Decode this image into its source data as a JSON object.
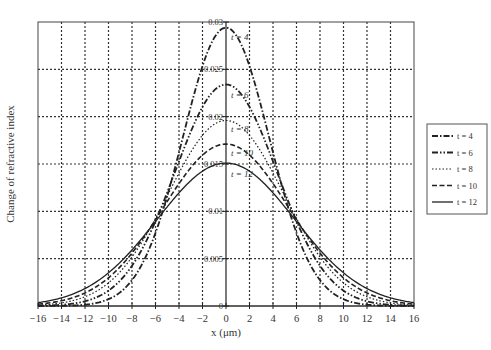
{
  "chart_data": {
    "type": "line",
    "title": "",
    "xlabel": "x (μm)",
    "ylabel": "Change of refractive index",
    "xlim": [
      -16,
      16
    ],
    "ylim": [
      0,
      0.03
    ],
    "xticks": [
      -16,
      -14,
      -12,
      -10,
      -8,
      -6,
      -4,
      -2,
      0,
      2,
      4,
      6,
      8,
      10,
      12,
      14,
      16
    ],
    "xtick_labels": [
      "−16",
      "−14",
      "−12",
      "−10",
      "−8",
      "−6",
      "−4",
      "−2",
      "0",
      "2",
      "4",
      "6",
      "8",
      "10",
      "12",
      "14",
      "16"
    ],
    "yticks": [
      0,
      0.005,
      0.01,
      0.015,
      0.02,
      0.025,
      0.03
    ],
    "ytick_labels": [
      "0",
      "0.005",
      "0.01",
      "0.015",
      "0.02",
      "0.025",
      "0.03"
    ],
    "grid": true,
    "legend_position": "right",
    "x": [
      -16,
      -15,
      -14,
      -13,
      -12,
      -11,
      -10,
      -9,
      -8,
      -7,
      -6,
      -5,
      -4,
      -3,
      -2,
      -1,
      0,
      1,
      2,
      3,
      4,
      5,
      6,
      7,
      8,
      9,
      10,
      11,
      12,
      13,
      14,
      15,
      16
    ],
    "series": [
      {
        "name": "t = 4",
        "label": "t = 4",
        "style": "dashdot",
        "peak": 0.0294,
        "sigma": 3.67,
        "values": [
          0.0,
          0.0,
          0.0,
          0.0,
          0.0,
          3e-05,
          0.0007,
          0.00029,
          0.00137,
          0.00469,
          0.01128,
          0.01947,
          0.02406,
          0.02799,
          0.02914,
          0.02911,
          0.0294,
          0.02911,
          0.02814,
          0.02585,
          0.02406,
          0.01947,
          0.01128,
          0.00469,
          0.00137,
          0.00029,
          7e-05,
          3e-05,
          0.0,
          0.0,
          0.0,
          0.0,
          0.0
        ]
      },
      {
        "name": "t = 6",
        "label": "t = 6",
        "style": "dashdotdot",
        "peak": 0.0234,
        "sigma": 4.33,
        "values": [
          0.0,
          0.0,
          0.0,
          2e-05,
          5e-05,
          0.00025,
          0.00079,
          0.00212,
          0.00469,
          0.0088,
          0.01404,
          0.01896,
          0.02023,
          0.02298,
          0.02261,
          0.02358,
          0.0234,
          0.02358,
          0.02261,
          0.02298,
          0.02023,
          0.01896,
          0.01404,
          0.0088,
          0.00469,
          0.00212,
          0.00079,
          0.00025,
          5e-05,
          2e-05,
          0.0,
          0.0,
          0.0
        ]
      },
      {
        "name": "t = 8",
        "label": "t = 8",
        "style": "dotted",
        "peak": 0.0196,
        "sigma": 4.9,
        "values": [
          0.0,
          1e-05,
          3e-05,
          0.0001,
          0.00031,
          0.00079,
          0.00175,
          0.00339,
          0.00582,
          0.00857,
          0.01162,
          0.01559,
          0.01793,
          0.01899,
          0.01916,
          0.01926,
          0.0196,
          0.01926,
          0.01916,
          0.01899,
          0.01793,
          0.01559,
          0.01162,
          0.00857,
          0.00582,
          0.00339,
          0.00175,
          0.00079,
          0.00031,
          0.0001,
          3e-05,
          1e-05,
          0.0
        ]
      },
      {
        "name": "t = 10",
        "label": "t = 10",
        "style": "dashed",
        "peak": 0.0171,
        "sigma": 5.35,
        "values": [
          2e-05,
          5e-05,
          0.00014,
          0.00035,
          0.00078,
          0.00147,
          0.00254,
          0.00434,
          0.00642,
          0.00866,
          0.01156,
          0.01385,
          0.01538,
          0.01638,
          0.01693,
          0.01699,
          0.0171,
          0.01699,
          0.01693,
          0.01638,
          0.01538,
          0.01385,
          0.01156,
          0.00866,
          0.00642,
          0.00434,
          0.00254,
          0.00147,
          0.00078,
          0.00035,
          0.00014,
          5e-05,
          2e-05
        ]
      },
      {
        "name": "t = 12",
        "label": "t = 12",
        "style": "solid",
        "peak": 0.0151,
        "sigma": 5.85,
        "values": [
          4e-05,
          0.00013,
          0.00035,
          0.00066,
          0.00109,
          0.00191,
          0.00323,
          0.00476,
          0.0066,
          0.00878,
          0.01097,
          0.01226,
          0.01347,
          0.01428,
          0.01482,
          0.01502,
          0.0151,
          0.01502,
          0.01482,
          0.01428,
          0.01347,
          0.01226,
          0.01097,
          0.00878,
          0.0066,
          0.00476,
          0.00323,
          0.00191,
          0.00109,
          0.00066,
          0.00035,
          0.00013,
          4e-05
        ]
      }
    ]
  }
}
